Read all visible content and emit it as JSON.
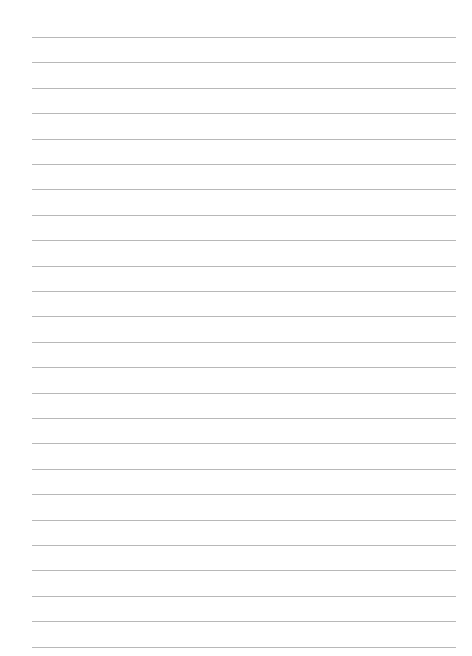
{
  "page": {
    "type": "lined-paper",
    "line_count": 25,
    "line_color": "#b8b8b8",
    "background_color": "#ffffff"
  }
}
